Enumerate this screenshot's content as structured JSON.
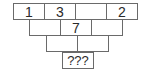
{
  "puzzle": {
    "type": "number-pyramid",
    "rows": [
      {
        "cells": [
          "1",
          "3",
          "",
          "2"
        ]
      },
      {
        "cells": [
          "",
          "7",
          ""
        ]
      },
      {
        "cells": [
          "",
          ""
        ]
      },
      {
        "cells": [
          "???"
        ]
      }
    ],
    "colors": {
      "border": "#6a6a6a",
      "text": "#2a2a2a",
      "background": "#ffffff"
    }
  }
}
